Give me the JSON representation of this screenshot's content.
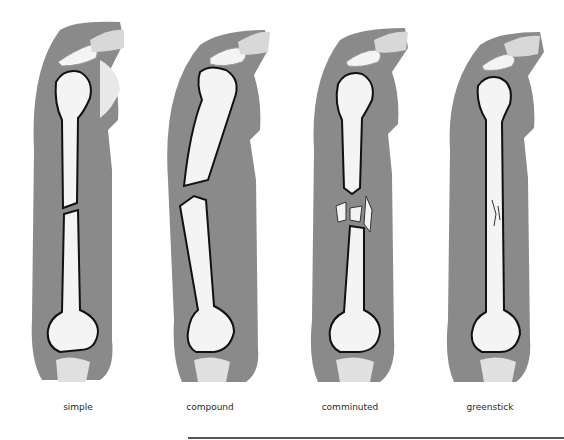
{
  "figure": {
    "panels": [
      {
        "id": "simple",
        "label": "simple"
      },
      {
        "id": "compound",
        "label": "compound"
      },
      {
        "id": "comminuted",
        "label": "comminuted"
      },
      {
        "id": "greenstick",
        "label": "greenstick"
      }
    ]
  },
  "colors": {
    "skin": "#8a8a8a",
    "bone": "#f4f4f4",
    "outline": "#111111",
    "background": "#ffffff"
  }
}
